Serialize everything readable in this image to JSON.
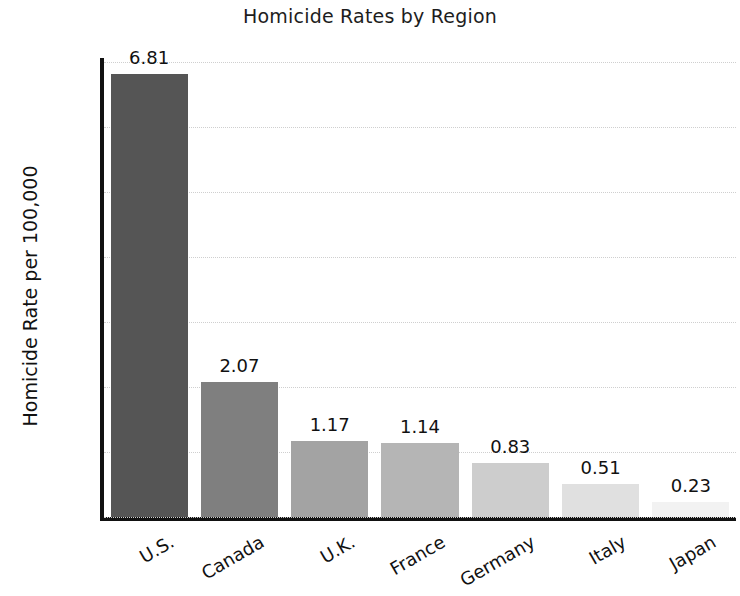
{
  "chart_data": {
    "type": "bar",
    "title": "Homicide Rates by Region",
    "xlabel": "",
    "ylabel": "Homicide Rate per 100,000",
    "categories": [
      "U.S.",
      "Canada",
      "U.K.",
      "France",
      "Germany",
      "Italy",
      "Japan"
    ],
    "values": [
      6.81,
      2.07,
      1.17,
      1.14,
      0.83,
      0.51,
      0.23
    ],
    "value_labels": [
      "6.81",
      "2.07",
      "1.17",
      "1.14",
      "0.83",
      "0.51",
      "0.23"
    ],
    "ylim": [
      0,
      7
    ],
    "yticks": [
      0,
      1,
      2,
      3,
      4,
      5,
      6,
      7
    ],
    "ytick_labels": [
      "0",
      "1",
      "2",
      "3",
      "4",
      "5",
      "6",
      "7"
    ],
    "grid": true,
    "grid_axis": "y",
    "grid_style": "dotted",
    "legend": null,
    "bar_colors": [
      "#555555",
      "#7f7f7f",
      "#a3a3a3",
      "#b5b5b5",
      "#cdcdcd",
      "#e0e0e0",
      "#f2f2f2"
    ],
    "grid_color": "#cfcfcf",
    "axis_color": "#111111",
    "background_color": "#ffffff",
    "xtick_rotation": -30
  }
}
